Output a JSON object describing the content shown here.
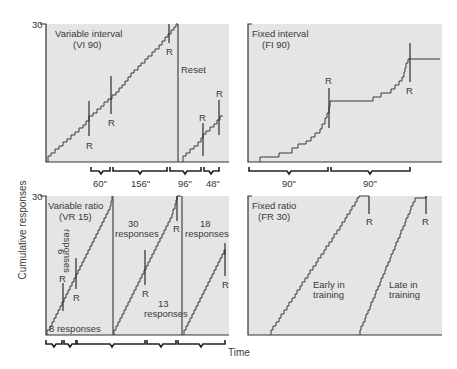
{
  "figure": {
    "y_axis_label": "Cumulative responses",
    "x_axis_label": "Time",
    "y_max_label": "30",
    "background": "#ffffff",
    "panel_fill": "#e5e5e5",
    "ink": "#333333"
  },
  "panels": [
    {
      "id": "vi",
      "title_line1": "Variable interval",
      "title_line2": "(VI 90)",
      "reinforcer_label": "R",
      "reset_label": "Reset",
      "interval_labels": [
        "60\"",
        "156\"",
        "96\"",
        "48\""
      ],
      "reinforcement_marks": 5
    },
    {
      "id": "fi",
      "title_line1": "Fixed interval",
      "title_line2": "(FI 90)",
      "reinforcer_label": "R",
      "interval_labels": [
        "90\"",
        "90\""
      ],
      "reinforcement_marks": 2
    },
    {
      "id": "vr",
      "title_line1": "Variable ratio",
      "title_line2": "(VR 15)",
      "reinforcer_label": "R",
      "annotations": {
        "six_count": "6",
        "six_word": "responses",
        "eight": "8 responses",
        "thirty_count": "30",
        "thirty_word": "responses",
        "thirteen_count": "13",
        "thirteen_word": "responses",
        "eighteen_count": "18",
        "eighteen_word": "responses"
      },
      "reinforcement_marks": 5
    },
    {
      "id": "fr",
      "title_line1": "Fixed ratio",
      "title_line2": "(FR 30)",
      "reinforcer_label": "R",
      "curve_labels": {
        "early_line1": "Early in",
        "early_line2": "training",
        "late_line1": "Late in",
        "late_line2": "training"
      },
      "reinforcement_marks": 2
    }
  ]
}
